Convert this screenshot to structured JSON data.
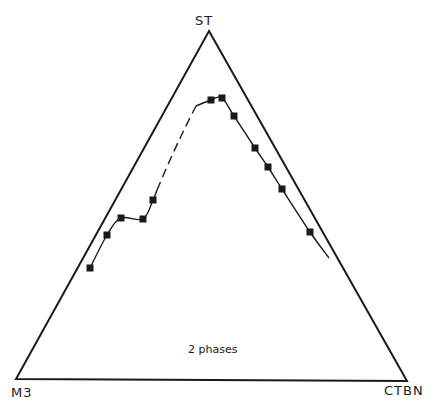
{
  "diagram": {
    "type": "ternary-phase-diagram",
    "vertices": {
      "top": {
        "label": "ST",
        "x": 209,
        "y": 31
      },
      "left": {
        "label": "M3",
        "x": 16,
        "y": 379
      },
      "right": {
        "label": "CTBN",
        "x": 407,
        "y": 381
      }
    },
    "region_label": "2 phases",
    "colors": {
      "line": "#1a1a1a",
      "marker": "#1a1a1a",
      "background": "#ffffff"
    },
    "curve": {
      "left_branch_points": [
        [
          90,
          268
        ],
        [
          107,
          235
        ],
        [
          121,
          218
        ],
        [
          143,
          219
        ],
        [
          153,
          200
        ]
      ],
      "dashed_segment": [
        [
          157,
          190
        ],
        [
          170,
          160
        ],
        [
          183,
          132
        ],
        [
          196,
          106
        ]
      ],
      "right_branch_points": [
        [
          211,
          100
        ],
        [
          222,
          98
        ],
        [
          234,
          116
        ],
        [
          255,
          148
        ],
        [
          268,
          167
        ],
        [
          282,
          189
        ],
        [
          310,
          232
        ]
      ],
      "right_branch_end": [
        329,
        258
      ],
      "markers": [
        [
          90,
          268
        ],
        [
          107,
          235
        ],
        [
          121,
          218
        ],
        [
          143,
          219
        ],
        [
          153,
          200
        ],
        [
          211,
          100
        ],
        [
          222,
          98
        ],
        [
          234,
          116
        ],
        [
          255,
          148
        ],
        [
          268,
          167
        ],
        [
          282,
          189
        ],
        [
          310,
          232
        ]
      ]
    }
  }
}
